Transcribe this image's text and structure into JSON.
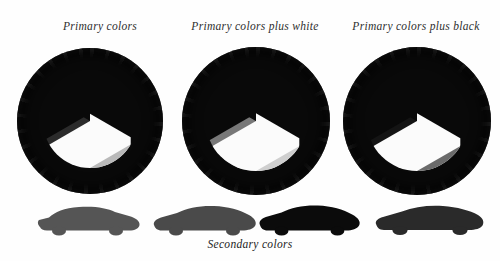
{
  "page": {
    "background": "#fefefe",
    "caption": "Secondary colors",
    "text_color": "#2e2e2e"
  },
  "wheels": [
    {
      "id": "wheel-primary",
      "heading": "Primary colors",
      "tire_color": "#090909",
      "wedges": [
        {
          "index": 0,
          "position": "top",
          "color": "#2b2b2b"
        },
        {
          "index": 1,
          "position": "upper-right",
          "color": "#fbfbfb"
        },
        {
          "index": 2,
          "position": "lower-right",
          "color": "#b9b9b9"
        },
        {
          "index": 3,
          "position": "bottom",
          "color": "#fbfbfb"
        },
        {
          "index": 4,
          "position": "lower-left",
          "color": "#0d0d0d"
        },
        {
          "index": 5,
          "position": "upper-left",
          "color": "#fbfbfb"
        }
      ]
    },
    {
      "id": "wheel-primary-plus-white",
      "heading": "Primary colors plus white",
      "tire_color": "#090909",
      "wedges": [
        {
          "index": 0,
          "position": "top",
          "color": "#787878"
        },
        {
          "index": 1,
          "position": "upper-right",
          "color": "#fbfbfb"
        },
        {
          "index": 2,
          "position": "lower-right",
          "color": "#cfcfcf"
        },
        {
          "index": 3,
          "position": "bottom",
          "color": "#fbfbfb"
        },
        {
          "index": 4,
          "position": "lower-left",
          "color": "#868686"
        },
        {
          "index": 5,
          "position": "upper-left",
          "color": "#fbfbfb"
        }
      ]
    },
    {
      "id": "wheel-primary-plus-black",
      "heading": "Primary colors plus black",
      "tire_color": "#090909",
      "wedges": [
        {
          "index": 0,
          "position": "top",
          "color": "#141414"
        },
        {
          "index": 1,
          "position": "upper-right",
          "color": "#fbfbfb"
        },
        {
          "index": 2,
          "position": "lower-right",
          "color": "#6b6b6b"
        },
        {
          "index": 3,
          "position": "bottom",
          "color": "#fbfbfb"
        },
        {
          "index": 4,
          "position": "lower-left",
          "color": "#090909"
        },
        {
          "index": 5,
          "position": "upper-left",
          "color": "#fbfbfb"
        }
      ]
    }
  ],
  "cars": [
    {
      "id": "car-1",
      "color": "#555555",
      "style": "coupe-notchback"
    },
    {
      "id": "car-2",
      "color": "#4a4a4a",
      "style": "fastback"
    },
    {
      "id": "car-3",
      "color": "#0b0b0b",
      "style": "fastback"
    },
    {
      "id": "car-4",
      "color": "#2a2a2a",
      "style": "long-fastback"
    }
  ]
}
